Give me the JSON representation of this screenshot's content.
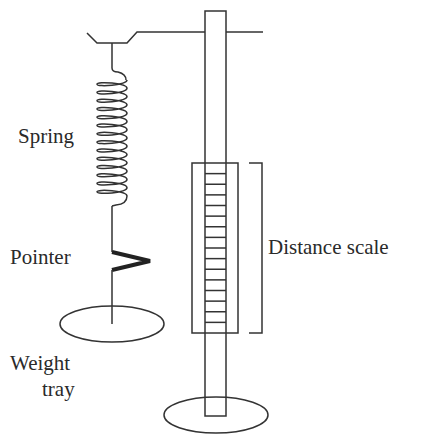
{
  "diagram": {
    "type": "physics-apparatus",
    "labels": {
      "spring": "Spring",
      "pointer": "Pointer",
      "weight_tray_line1": "Weight",
      "weight_tray_line2": "tray",
      "distance_scale": "Distance scale"
    },
    "components": [
      {
        "id": "stand-rod",
        "desc": "vertical support rod"
      },
      {
        "id": "stand-base",
        "desc": "elliptical base of stand"
      },
      {
        "id": "cross-arm",
        "desc": "horizontal arm with hanger bracket"
      },
      {
        "id": "spring",
        "desc": "coil spring, ~14 coils"
      },
      {
        "id": "pointer",
        "desc": "V-shaped pointer on wire"
      },
      {
        "id": "weight-tray",
        "desc": "elliptical tray"
      },
      {
        "id": "distance-scale",
        "desc": "ruled scale box on rod",
        "tick_count": 15
      }
    ],
    "colors": {
      "line": "#333333",
      "text": "#2a2a2a",
      "background": "#ffffff"
    }
  }
}
